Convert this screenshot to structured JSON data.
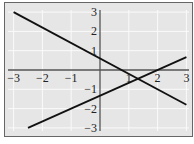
{
  "chart_data": {
    "type": "line",
    "title": "",
    "xlabel": "",
    "ylabel": "",
    "xlim": [
      -3,
      3
    ],
    "ylim": [
      -3,
      3
    ],
    "grid": true,
    "x_ticks": [
      "-3",
      "-2",
      "-1",
      "1",
      "2",
      "3"
    ],
    "y_ticks": [
      "3",
      "2",
      "1",
      "-1",
      "-2",
      "-3"
    ],
    "series": [
      {
        "name": "line-descending",
        "x": [
          -3,
          3
        ],
        "y": [
          3.0,
          -1.8
        ],
        "slope": -0.8,
        "intercept": 0.6
      },
      {
        "name": "line-ascending",
        "x": [
          -2.5,
          3
        ],
        "y": [
          -3.0,
          0.67
        ],
        "slope": 0.667,
        "intercept": -1.33
      }
    ],
    "intersection": {
      "x": 1.31,
      "y": -0.45
    }
  },
  "colors": {
    "background": "#e6e6e6",
    "grid": "#fafafa",
    "axis": "#555555",
    "line": "#111111",
    "frame": "#666666"
  }
}
